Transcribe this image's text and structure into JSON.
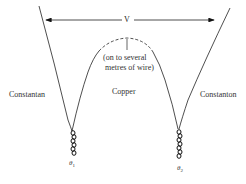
{
  "diagram": {
    "voltage_label": "V",
    "note_line1": "(on to several",
    "note_line2": "metres of wire)",
    "left_wire_label": "Constantan",
    "middle_wire_label": "Copper",
    "right_wire_label": "Constanton",
    "junction1": {
      "symbol": "θ",
      "subscript": "1"
    },
    "junction2": {
      "symbol": "θ",
      "subscript": "2"
    }
  }
}
